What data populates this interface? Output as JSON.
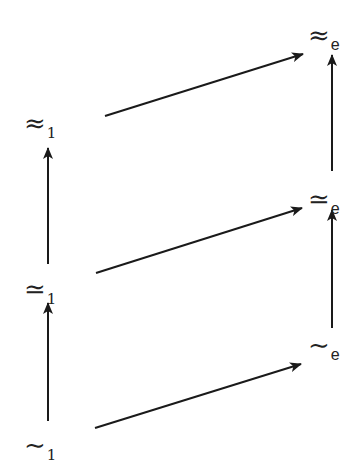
{
  "diagram": {
    "nodes": {
      "approx_1": {
        "symbol": "≈",
        "subscript": "1"
      },
      "simeq_1": {
        "symbol": "≃",
        "subscript": "1"
      },
      "sim_1": {
        "symbol": "∼",
        "subscript": "1"
      },
      "approx_e": {
        "symbol": "≈",
        "subscript": "e"
      },
      "simeq_e": {
        "symbol": "≃",
        "subscript": "e"
      },
      "sim_e": {
        "symbol": "∼",
        "subscript": "e"
      }
    },
    "edges": [
      {
        "from": "sim_1",
        "to": "simeq_1"
      },
      {
        "from": "simeq_1",
        "to": "approx_1"
      },
      {
        "from": "sim_e",
        "to": "simeq_e"
      },
      {
        "from": "simeq_e",
        "to": "approx_e"
      },
      {
        "from": "approx_1",
        "to": "approx_e"
      },
      {
        "from": "simeq_1",
        "to": "simeq_e"
      },
      {
        "from": "sim_1",
        "to": "sim_e"
      }
    ],
    "colors": {
      "stroke": "#1a1a1a",
      "background": "#ffffff"
    }
  }
}
